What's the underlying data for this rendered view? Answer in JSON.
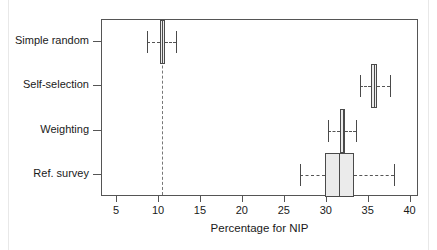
{
  "chart_data": {
    "type": "box",
    "orientation": "horizontal",
    "title": "",
    "xlabel": "Percentage for NIP",
    "ylabel": "",
    "xlim": [
      3.2,
      41.0
    ],
    "xticks": [
      5,
      10,
      15,
      20,
      25,
      30,
      35,
      40
    ],
    "xticklabels": [
      "5",
      "10",
      "15",
      "20",
      "25",
      "30",
      "35",
      "40"
    ],
    "grid": false,
    "legend": null,
    "reference_line": {
      "value": 10.4,
      "style": "dashed",
      "orientation": "vertical"
    },
    "categories": [
      "Simple random",
      "Self-selection",
      "Weighting",
      "Ref. survey"
    ],
    "boxes": [
      {
        "category": "Simple random",
        "whisker_low": 8.6,
        "q1": 10.1,
        "median": 10.4,
        "q3": 10.7,
        "whisker_high": 12.0
      },
      {
        "category": "Self-selection",
        "whisker_low": 34.0,
        "q1": 35.3,
        "median": 35.6,
        "q3": 36.0,
        "whisker_high": 37.5
      },
      {
        "category": "Weighting",
        "whisker_low": 30.1,
        "q1": 31.6,
        "median": 31.9,
        "q3": 32.2,
        "whisker_high": 33.5
      },
      {
        "category": "Ref. survey",
        "whisker_low": 26.8,
        "q1": 29.8,
        "median": 31.5,
        "q3": 33.2,
        "whisker_high": 38.0
      }
    ],
    "colors": {
      "box_fill": "#ebebeb",
      "box_stroke": "#4a4a4a",
      "whisker": "#555555",
      "frame": "#555555",
      "reference_line": "#777777",
      "text": "#1a1a1a"
    }
  }
}
